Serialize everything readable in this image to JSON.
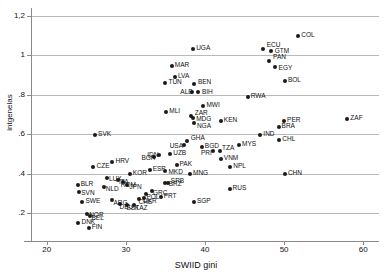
{
  "chart_data": {
    "type": "scatter",
    "title": "",
    "xlabel": "SWIID gini",
    "ylabel": "intgenelas",
    "xlim": [
      18,
      62
    ],
    "ylim": [
      0.1,
      1.24
    ],
    "xticks": [
      20,
      30,
      40,
      50,
      60
    ],
    "xtick_labels": [
      "20",
      "30",
      "40",
      "50",
      "60"
    ],
    "yticks": [
      0.2,
      0.4,
      0.6,
      0.8,
      1.0,
      1.2
    ],
    "ytick_labels": [
      ".2",
      ".4",
      ".6",
      ".8",
      "1",
      "1,2"
    ],
    "grid": "horizontal",
    "legend": "none",
    "marker_color": "#1a1a1a",
    "grid_color": "#b9b9b9",
    "points": [
      {
        "label": "COL",
        "x": 51.8,
        "y": 1.1
      },
      {
        "label": "ECU",
        "x": 47.3,
        "y": 1.03
      },
      {
        "label": "GTM",
        "x": 48.3,
        "y": 1.02
      },
      {
        "label": "UGA",
        "x": 38.5,
        "y": 1.03
      },
      {
        "label": "PAN",
        "x": 48.1,
        "y": 0.97
      },
      {
        "label": "EGY",
        "x": 48.8,
        "y": 0.94
      },
      {
        "label": "MAR",
        "x": 35.8,
        "y": 0.945
      },
      {
        "label": "LVA",
        "x": 36.2,
        "y": 0.89
      },
      {
        "label": "BOL",
        "x": 50.1,
        "y": 0.87
      },
      {
        "label": "TUN",
        "x": 35.0,
        "y": 0.86
      },
      {
        "label": "BEN",
        "x": 38.6,
        "y": 0.855
      },
      {
        "label": "ALB",
        "x": 38.4,
        "y": 0.815
      },
      {
        "label": "BIH",
        "x": 39.1,
        "y": 0.815
      },
      {
        "label": "RWA",
        "x": 45.4,
        "y": 0.79
      },
      {
        "label": "MWI",
        "x": 39.8,
        "y": 0.745
      },
      {
        "label": "MLI",
        "x": 35.1,
        "y": 0.715
      },
      {
        "label": "ZAR",
        "x": 38.2,
        "y": 0.695
      },
      {
        "label": "MDG",
        "x": 38.5,
        "y": 0.685
      },
      {
        "label": "ZAF",
        "x": 58.0,
        "y": 0.68
      },
      {
        "label": "PER",
        "x": 50.0,
        "y": 0.67
      },
      {
        "label": "KEN",
        "x": 42.0,
        "y": 0.67
      },
      {
        "label": "NGA",
        "x": 38.6,
        "y": 0.655
      },
      {
        "label": "BRA",
        "x": 49.3,
        "y": 0.635
      },
      {
        "label": "IND",
        "x": 47.0,
        "y": 0.595
      },
      {
        "label": "SVK",
        "x": 26.1,
        "y": 0.595
      },
      {
        "label": "CHL",
        "x": 49.4,
        "y": 0.57
      },
      {
        "label": "GHA",
        "x": 37.7,
        "y": 0.565
      },
      {
        "label": "USA",
        "x": 37.3,
        "y": 0.545
      },
      {
        "label": "MYS",
        "x": 44.3,
        "y": 0.545
      },
      {
        "label": "BGD",
        "x": 39.6,
        "y": 0.535
      },
      {
        "label": "TZA",
        "x": 41.9,
        "y": 0.515
      },
      {
        "label": "PRI",
        "x": 41.0,
        "y": 0.515
      },
      {
        "label": "UZB",
        "x": 35.6,
        "y": 0.5
      },
      {
        "label": "IDN",
        "x": 34.2,
        "y": 0.495
      },
      {
        "label": "VNM",
        "x": 42.0,
        "y": 0.475
      },
      {
        "label": "BGR",
        "x": 33.6,
        "y": 0.485
      },
      {
        "label": "HRV",
        "x": 28.3,
        "y": 0.46
      },
      {
        "label": "PAK",
        "x": 36.4,
        "y": 0.445
      },
      {
        "label": "CZE",
        "x": 25.9,
        "y": 0.435
      },
      {
        "label": "NPL",
        "x": 43.2,
        "y": 0.435
      },
      {
        "label": "ESP",
        "x": 33.0,
        "y": 0.42
      },
      {
        "label": "MKD",
        "x": 35.0,
        "y": 0.412
      },
      {
        "label": "KOR",
        "x": 30.5,
        "y": 0.398
      },
      {
        "label": "MNG",
        "x": 38.1,
        "y": 0.4
      },
      {
        "label": "CHN",
        "x": 50.1,
        "y": 0.4
      },
      {
        "label": "LUX",
        "x": 27.6,
        "y": 0.378
      },
      {
        "label": "ITA",
        "x": 29.0,
        "y": 0.368
      },
      {
        "label": "ROM",
        "x": 29.6,
        "y": 0.358
      },
      {
        "label": "BRZ",
        "x": 34.9,
        "y": 0.352
      },
      {
        "label": "SRB",
        "x": 35.3,
        "y": 0.352
      },
      {
        "label": "BLR",
        "x": 23.9,
        "y": 0.342
      },
      {
        "label": "JPN",
        "x": 30.2,
        "y": 0.345
      },
      {
        "label": "NLD",
        "x": 27.2,
        "y": 0.333
      },
      {
        "label": "RUS",
        "x": 43.1,
        "y": 0.325
      },
      {
        "label": "SVN",
        "x": 24.1,
        "y": 0.308
      },
      {
        "label": "GRC",
        "x": 33.3,
        "y": 0.315
      },
      {
        "label": "POL",
        "x": 32.6,
        "y": 0.298
      },
      {
        "label": "PRT",
        "x": 34.4,
        "y": 0.283
      },
      {
        "label": "SWE",
        "x": 24.5,
        "y": 0.258
      },
      {
        "label": "SGP",
        "x": 38.6,
        "y": 0.258
      },
      {
        "label": "ARG",
        "x": 28.3,
        "y": 0.268
      },
      {
        "label": "CHE",
        "x": 31.6,
        "y": 0.272
      },
      {
        "label": "UKR",
        "x": 32.3,
        "y": 0.278
      },
      {
        "label": "DEU",
        "x": 29.2,
        "y": 0.248
      },
      {
        "label": "EST",
        "x": 30.2,
        "y": 0.243
      },
      {
        "label": "KAZ",
        "x": 31.0,
        "y": 0.243
      },
      {
        "label": "NOR",
        "x": 25.1,
        "y": 0.198
      },
      {
        "label": "BEL",
        "x": 25.4,
        "y": 0.188
      },
      {
        "label": "DNK",
        "x": 24.0,
        "y": 0.153
      },
      {
        "label": "FIN",
        "x": 25.3,
        "y": 0.125
      }
    ],
    "label_offsets": {
      "ECU": {
        "dx": 4,
        "dy": -4
      },
      "GTM": {
        "dx": 4,
        "dy": 0
      },
      "PAN": {
        "dx": 4,
        "dy": -4
      },
      "EGY": {
        "dx": 4,
        "dy": 1
      },
      "BEN": {
        "dx": 4,
        "dy": -2
      },
      "ALB": {
        "dx": -12,
        "dy": 0
      },
      "BIH": {
        "dx": 4,
        "dy": 0
      },
      "ZAR": {
        "dx": 4,
        "dy": -3
      },
      "MDG": {
        "dx": 3,
        "dy": 1
      },
      "NGA": {
        "dx": 3,
        "dy": 3
      },
      "USA": {
        "dx": -14,
        "dy": 1
      },
      "GHA": {
        "dx": 4,
        "dy": -3
      },
      "TZA": {
        "dx": 2,
        "dy": -3
      },
      "PRI": {
        "dx": -12,
        "dy": 2
      },
      "IDN": {
        "dx": -12,
        "dy": 0
      },
      "BGR": {
        "dx": -13,
        "dy": 1
      },
      "BRZ": {
        "dx": 4,
        "dy": 1
      },
      "SRB": {
        "dx": 3,
        "dy": -2
      },
      "ITA": {
        "dx": 1,
        "dy": 2
      },
      "ROM": {
        "dx": -2,
        "dy": 3
      },
      "JPN": {
        "dx": 2,
        "dy": 2
      },
      "NLD": {
        "dx": 2,
        "dy": 2
      },
      "SVN": {
        "dx": 2,
        "dy": 1
      },
      "GRC": {
        "dx": 1,
        "dy": 2
      },
      "POL": {
        "dx": 0,
        "dy": 3
      },
      "ARG": {
        "dx": 1,
        "dy": 3
      },
      "CHE": {
        "dx": 0,
        "dy": 3
      },
      "UKR": {
        "dx": -1,
        "dy": 3
      },
      "DEU": {
        "dx": 0,
        "dy": 3
      },
      "EST": {
        "dx": -1,
        "dy": 3
      },
      "KAZ": {
        "dx": 1,
        "dy": 3
      },
      "NOR": {
        "dx": 2,
        "dy": 1
      },
      "BEL": {
        "dx": 2,
        "dy": 2
      },
      "LUX": {
        "dx": 2,
        "dy": 1
      },
      "MKD": {
        "dx": 3,
        "dy": 1
      }
    }
  }
}
